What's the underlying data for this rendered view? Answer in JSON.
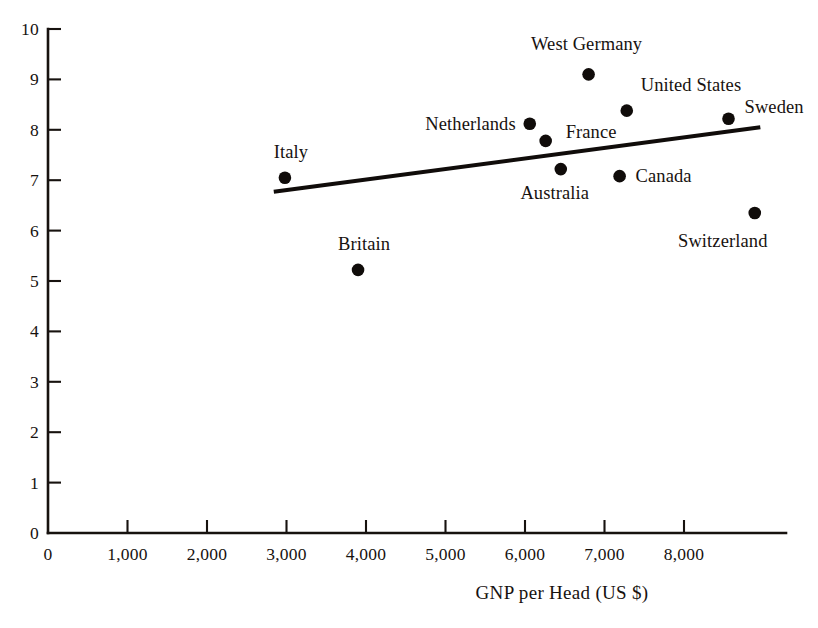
{
  "chart_data": {
    "type": "scatter",
    "title": "",
    "xlabel": "GNP per Head (US $)",
    "ylabel": "",
    "xlim": [
      0,
      9300
    ],
    "ylim": [
      0,
      10
    ],
    "grid": false,
    "legend": "none",
    "x_tick_labels": [
      "0",
      "1,000",
      "2,000",
      "3,000",
      "4,000",
      "5,000",
      "6,000",
      "7,000",
      "8,000"
    ],
    "x_tick_values": [
      0,
      1000,
      2000,
      3000,
      4000,
      5000,
      6000,
      7000,
      8000
    ],
    "y_tick_labels": [
      "0",
      "1",
      "2",
      "3",
      "4",
      "5",
      "6",
      "7",
      "8",
      "9",
      "10"
    ],
    "y_tick_values": [
      0,
      1,
      2,
      3,
      4,
      5,
      6,
      7,
      8,
      9,
      10
    ],
    "points": [
      {
        "label": "Italy",
        "x": 2980,
        "y": 7.05,
        "label_anchor": "mid",
        "label_dx": 6,
        "label_dy": -26
      },
      {
        "label": "Britain",
        "x": 3900,
        "y": 5.22,
        "label_anchor": "mid",
        "label_dx": 6,
        "label_dy": -26
      },
      {
        "label": "Netherlands",
        "x": 6060,
        "y": 8.12,
        "label_anchor": "end",
        "label_dx": -14,
        "label_dy": 0
      },
      {
        "label": "France",
        "x": 6260,
        "y": 7.78,
        "label_anchor": "start",
        "label_dx": 20,
        "label_dy": -9
      },
      {
        "label": "Australia",
        "x": 6450,
        "y": 7.22,
        "label_anchor": "mid",
        "label_dx": -6,
        "label_dy": 24
      },
      {
        "label": "West Germany",
        "x": 6800,
        "y": 9.1,
        "label_anchor": "mid",
        "label_dx": -2,
        "label_dy": -30
      },
      {
        "label": "United States",
        "x": 7280,
        "y": 8.38,
        "label_anchor": "start",
        "label_dx": 14,
        "label_dy": -26
      },
      {
        "label": "Canada",
        "x": 7190,
        "y": 7.08,
        "label_anchor": "start",
        "label_dx": 16,
        "label_dy": 0
      },
      {
        "label": "Sweden",
        "x": 8560,
        "y": 8.22,
        "label_anchor": "start",
        "label_dx": 16,
        "label_dy": -12
      },
      {
        "label": "Switzerland",
        "x": 8890,
        "y": 6.35,
        "label_anchor": "mid",
        "label_dx": -32,
        "label_dy": 28
      }
    ],
    "trend_line": {
      "x_start": 2840,
      "y_start": 6.77,
      "x_end": 8960,
      "y_end": 8.05
    }
  },
  "axes": {
    "origin_label_x": "0",
    "origin_label_y": "0"
  }
}
